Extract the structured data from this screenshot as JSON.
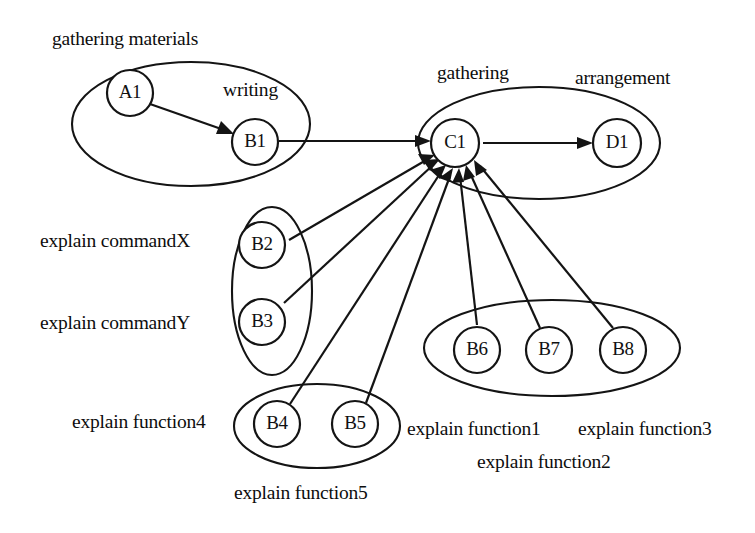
{
  "diagram": {
    "background_color": "#ffffff",
    "stroke_color": "#141414",
    "width": 755,
    "height": 533,
    "nodes": [
      {
        "id": "A1",
        "label": "A1",
        "cx": 130,
        "cy": 93,
        "r": 23
      },
      {
        "id": "B1",
        "label": "B1",
        "cx": 255,
        "cy": 142,
        "r": 23
      },
      {
        "id": "C1",
        "label": "C1",
        "cx": 455,
        "cy": 143,
        "r": 24
      },
      {
        "id": "D1",
        "label": "D1",
        "cx": 617,
        "cy": 143,
        "r": 24
      },
      {
        "id": "B2",
        "label": "B2",
        "cx": 262,
        "cy": 245,
        "r": 23
      },
      {
        "id": "B3",
        "label": "B3",
        "cx": 262,
        "cy": 322,
        "r": 23
      },
      {
        "id": "B4",
        "label": "B4",
        "cx": 277,
        "cy": 424,
        "r": 23
      },
      {
        "id": "B5",
        "label": "B5",
        "cx": 355,
        "cy": 424,
        "r": 23
      },
      {
        "id": "B6",
        "label": "B6",
        "cx": 477,
        "cy": 350,
        "r": 23
      },
      {
        "id": "B7",
        "label": "B7",
        "cx": 549,
        "cy": 350,
        "r": 23
      },
      {
        "id": "B8",
        "label": "B8",
        "cx": 623,
        "cy": 350,
        "r": 23
      }
    ],
    "groups": [
      {
        "id": "gathering-materials-group",
        "cx": 191,
        "cy": 124,
        "rx": 119,
        "ry": 62,
        "members": [
          "A1",
          "B1"
        ]
      },
      {
        "id": "gathering-group",
        "cx": 539,
        "cy": 143,
        "rx": 121,
        "ry": 56,
        "members": [
          "C1",
          "D1"
        ]
      },
      {
        "id": "commands-group",
        "cx": 272,
        "cy": 291,
        "rx": 40,
        "ry": 84,
        "members": [
          "B2",
          "B3"
        ]
      },
      {
        "id": "function45-group",
        "cx": 317,
        "cy": 426,
        "rx": 83,
        "ry": 42,
        "members": [
          "B4",
          "B5"
        ]
      },
      {
        "id": "function123-group",
        "cx": 552,
        "cy": 348,
        "rx": 128,
        "ry": 48,
        "members": [
          "B6",
          "B7",
          "B8"
        ]
      }
    ],
    "edges": [
      {
        "from": "A1",
        "to": "B1",
        "kind": "arrow"
      },
      {
        "from": "B1",
        "to": "C1",
        "kind": "arrow"
      },
      {
        "from": "C1",
        "to": "D1",
        "kind": "arrow"
      },
      {
        "from": "B2",
        "to": "C1",
        "kind": "arrow"
      },
      {
        "from": "B3",
        "to": "C1",
        "kind": "arrow"
      },
      {
        "from": "B4",
        "to": "C1",
        "kind": "arrow"
      },
      {
        "from": "B5",
        "to": "C1",
        "kind": "arrow"
      },
      {
        "from": "B6",
        "to": "C1",
        "kind": "arrow"
      },
      {
        "from": "B7",
        "to": "C1",
        "kind": "arrow"
      },
      {
        "from": "B8",
        "to": "C1",
        "kind": "arrow"
      }
    ],
    "captions": [
      {
        "id": "caption-gathering-materials",
        "text": "gathering materials",
        "x": 52,
        "y": 29
      },
      {
        "id": "caption-writing",
        "text": "writing",
        "x": 223,
        "y": 80
      },
      {
        "id": "caption-gathering",
        "text": "gathering",
        "x": 437,
        "y": 63
      },
      {
        "id": "caption-arrangement",
        "text": "arrangement",
        "x": 575,
        "y": 68
      },
      {
        "id": "caption-explain-commandx",
        "text": "explain commandX",
        "x": 40,
        "y": 231
      },
      {
        "id": "caption-explain-commandy",
        "text": "explain commandY",
        "x": 40,
        "y": 313
      },
      {
        "id": "caption-explain-function4",
        "text": "explain function4",
        "x": 72,
        "y": 412
      },
      {
        "id": "caption-explain-function5",
        "text": "explain function5",
        "x": 234,
        "y": 483
      },
      {
        "id": "caption-explain-function1",
        "text": "explain function1",
        "x": 407,
        "y": 419
      },
      {
        "id": "caption-explain-function3",
        "text": "explain function3",
        "x": 578,
        "y": 419
      },
      {
        "id": "caption-explain-function2",
        "text": "explain function2",
        "x": 477,
        "y": 452
      }
    ]
  }
}
